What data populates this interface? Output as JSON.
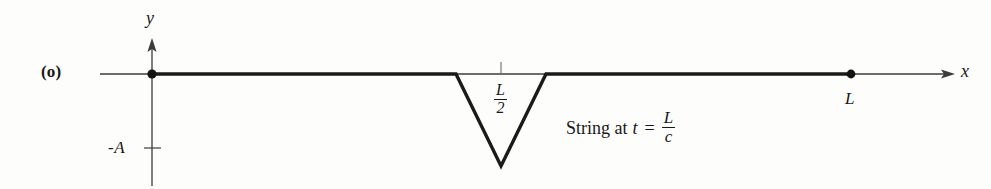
{
  "figure": {
    "panel_label": "(o)",
    "axes": {
      "y_label": "y",
      "x_label": "x",
      "y_tick_label": "-A",
      "origin_marker": "point-dot"
    },
    "markers": {
      "midpoint_label_numerator": "L",
      "midpoint_label_denominator": "2",
      "endpoint_label": "L"
    },
    "caption": {
      "text": "String at",
      "variable": "t",
      "equals": "=",
      "fraction_numerator": "L",
      "fraction_denominator": "c"
    },
    "colors": {
      "ink": "#181818",
      "string": "#1a1a1a",
      "axis": "#3a3a3a",
      "background": "#fdfdfc"
    },
    "geometry": {
      "axis_y_px": 74,
      "y_axis_x_px": 152,
      "string_start_x_px": 152,
      "string_end_x_px": 851,
      "pulse_left_x_px": 456,
      "pulse_vertex_x_px": 501,
      "pulse_vertex_y_px": 166,
      "pulse_right_x_px": 546,
      "neg_A_level_y_px": 148
    }
  }
}
